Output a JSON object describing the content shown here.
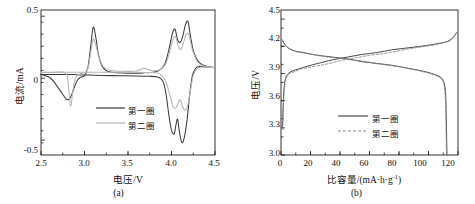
{
  "figure": {
    "panel_a_caption": "(a)",
    "panel_b_caption": "(b)"
  },
  "panel_a": {
    "xlabel": "电压/V",
    "ylabel": "电流/mA",
    "xticks": [
      "2.5",
      "3.0",
      "3.5",
      "4.0",
      "4.5"
    ],
    "yticks": [
      "0.5",
      "0",
      "-0.5"
    ],
    "legend": [
      {
        "label": "第一圈",
        "color": "#3a3a3a",
        "style": "solid"
      },
      {
        "label": "第二圈",
        "color": "#b0b0b0",
        "style": "solid"
      }
    ]
  },
  "panel_b": {
    "xlabel_main": "比容量/(mA·h·g",
    "xlabel_sup": "-1",
    "xlabel_tail": ")",
    "ylabel": "电压/V",
    "xticks": [
      "0",
      "20",
      "40",
      "60",
      "80",
      "100",
      "120"
    ],
    "yticks": [
      "4.5",
      "4.2",
      "3.9",
      "3.6",
      "3.3",
      "3.0"
    ],
    "legend": [
      {
        "label": "第一圈",
        "color": "#4a4a4a",
        "style": "solid"
      },
      {
        "label": "第二圈",
        "color": "#8a8a8a",
        "style": "dashed"
      }
    ]
  },
  "chart_data": [
    {
      "type": "line",
      "title": "(a) 循环伏安曲线",
      "xlabel": "电压/V",
      "ylabel": "电流/mA",
      "xlim": [
        2.5,
        4.5
      ],
      "ylim": [
        -0.62,
        0.55
      ],
      "xticks": [
        2.5,
        3.0,
        3.5,
        4.0,
        4.5
      ],
      "yticks": [
        0.5,
        0,
        -0.5
      ],
      "grid": false,
      "legend_position": "center",
      "series": [
        {
          "name": "第一圈",
          "color": "#3a3a3a",
          "points": [
            [
              2.5,
              0.03
            ],
            [
              2.55,
              0.02
            ],
            [
              2.6,
              0.005
            ],
            [
              2.65,
              -0.03
            ],
            [
              2.7,
              -0.08
            ],
            [
              2.74,
              -0.12
            ],
            [
              2.78,
              -0.16
            ],
            [
              2.8,
              -0.175
            ],
            [
              2.83,
              -0.165
            ],
            [
              2.86,
              -0.12
            ],
            [
              2.89,
              -0.06
            ],
            [
              2.92,
              -0.015
            ],
            [
              2.95,
              0.005
            ],
            [
              3.0,
              0.02
            ],
            [
              3.04,
              0.09
            ],
            [
              3.07,
              0.25
            ],
            [
              3.1,
              0.41
            ],
            [
              3.13,
              0.33
            ],
            [
              3.16,
              0.19
            ],
            [
              3.2,
              0.1
            ],
            [
              3.25,
              0.06
            ],
            [
              3.35,
              0.045
            ],
            [
              3.5,
              0.04
            ],
            [
              3.65,
              0.04
            ],
            [
              3.7,
              0.045
            ],
            [
              3.75,
              0.045
            ],
            [
              3.85,
              0.06
            ],
            [
              3.92,
              0.11
            ],
            [
              3.97,
              0.23
            ],
            [
              4.01,
              0.36
            ],
            [
              4.04,
              0.395
            ],
            [
              4.07,
              0.31
            ],
            [
              4.1,
              0.29
            ],
            [
              4.13,
              0.34
            ],
            [
              4.16,
              0.43
            ],
            [
              4.19,
              0.455
            ],
            [
              4.22,
              0.33
            ],
            [
              4.26,
              0.2
            ],
            [
              4.32,
              0.125
            ],
            [
              4.4,
              0.095
            ],
            [
              4.5,
              0.085
            ]
          ]
        },
        {
          "name": "第一圈-还原",
          "color": "#3a3a3a",
          "points": [
            [
              4.5,
              0.085
            ],
            [
              4.4,
              0.09
            ],
            [
              4.32,
              0.095
            ],
            [
              4.28,
              0.08
            ],
            [
              4.24,
              0.02
            ],
            [
              4.21,
              -0.13
            ],
            [
              4.18,
              -0.33
            ],
            [
              4.15,
              -0.47
            ],
            [
              4.12,
              -0.52
            ],
            [
              4.09,
              -0.43
            ],
            [
              4.07,
              -0.33
            ],
            [
              4.05,
              -0.38
            ],
            [
              4.03,
              -0.45
            ],
            [
              4.0,
              -0.42
            ],
            [
              3.97,
              -0.3
            ],
            [
              3.94,
              -0.14
            ],
            [
              3.91,
              -0.04
            ],
            [
              3.88,
              -0.005
            ],
            [
              3.84,
              0.01
            ],
            [
              3.75,
              0.015
            ],
            [
              3.6,
              0.018
            ],
            [
              3.4,
              0.02
            ],
            [
              3.2,
              0.022
            ],
            [
              3.05,
              0.025
            ],
            [
              2.95,
              0.025
            ],
            [
              2.9,
              0.028
            ],
            [
              2.85,
              0.03
            ],
            [
              2.7,
              0.03
            ],
            [
              2.5,
              0.03
            ]
          ]
        },
        {
          "name": "第二圈",
          "color": "#b5b5b5",
          "points": [
            [
              2.5,
              0.045
            ],
            [
              2.6,
              0.048
            ],
            [
              2.7,
              0.05
            ],
            [
              2.76,
              0.048
            ],
            [
              2.8,
              0.02
            ],
            [
              2.82,
              -0.1
            ],
            [
              2.84,
              -0.225
            ],
            [
              2.86,
              -0.14
            ],
            [
              2.88,
              -0.04
            ],
            [
              2.91,
              0.015
            ],
            [
              2.95,
              0.035
            ],
            [
              3.0,
              0.045
            ],
            [
              3.04,
              0.08
            ],
            [
              3.07,
              0.2
            ],
            [
              3.1,
              0.315
            ],
            [
              3.13,
              0.265
            ],
            [
              3.17,
              0.16
            ],
            [
              3.22,
              0.09
            ],
            [
              3.3,
              0.062
            ],
            [
              3.45,
              0.055
            ],
            [
              3.6,
              0.058
            ],
            [
              3.68,
              0.08
            ],
            [
              3.72,
              0.072
            ],
            [
              3.78,
              0.06
            ],
            [
              3.86,
              0.065
            ],
            [
              3.93,
              0.11
            ],
            [
              3.98,
              0.215
            ],
            [
              4.02,
              0.32
            ],
            [
              4.05,
              0.33
            ],
            [
              4.08,
              0.25
            ],
            [
              4.11,
              0.235
            ],
            [
              4.14,
              0.29
            ],
            [
              4.17,
              0.355
            ],
            [
              4.2,
              0.35
            ],
            [
              4.24,
              0.23
            ],
            [
              4.3,
              0.13
            ],
            [
              4.38,
              0.095
            ],
            [
              4.5,
              0.085
            ]
          ]
        },
        {
          "name": "第二圈-还原",
          "color": "#b5b5b5",
          "points": [
            [
              4.5,
              0.085
            ],
            [
              4.42,
              0.088
            ],
            [
              4.34,
              0.09
            ],
            [
              4.29,
              0.075
            ],
            [
              4.25,
              0.02
            ],
            [
              4.22,
              -0.09
            ],
            [
              4.19,
              -0.21
            ],
            [
              4.16,
              -0.26
            ],
            [
              4.13,
              -0.235
            ],
            [
              4.1,
              -0.175
            ],
            [
              4.08,
              -0.195
            ],
            [
              4.05,
              -0.24
            ],
            [
              4.02,
              -0.23
            ],
            [
              3.99,
              -0.16
            ],
            [
              3.96,
              -0.08
            ],
            [
              3.93,
              -0.02
            ],
            [
              3.89,
              0.02
            ],
            [
              3.85,
              0.04
            ],
            [
              3.78,
              0.045
            ],
            [
              3.6,
              0.048
            ],
            [
              3.4,
              0.048
            ],
            [
              3.2,
              0.048
            ],
            [
              3.0,
              0.048
            ],
            [
              2.8,
              0.048
            ],
            [
              2.6,
              0.046
            ],
            [
              2.5,
              0.045
            ]
          ]
        }
      ]
    },
    {
      "type": "line",
      "title": "(b) 充放电曲线",
      "xlabel": "比容量/(mA·h·g-1)",
      "ylabel": "电压/V",
      "xlim": [
        0,
        120
      ],
      "ylim": [
        3.0,
        4.6
      ],
      "xticks": [
        0,
        20,
        40,
        60,
        80,
        100,
        120
      ],
      "yticks": [
        3.0,
        3.3,
        3.6,
        3.9,
        4.2,
        4.5
      ],
      "grid": false,
      "legend_position": "center",
      "series": [
        {
          "name": "第一圈-充电",
          "color": "#4a4a4a",
          "style": "solid",
          "points": [
            [
              1.0,
              3.3
            ],
            [
              1.5,
              3.55
            ],
            [
              2.0,
              3.72
            ],
            [
              3.0,
              3.84
            ],
            [
              5.0,
              3.9
            ],
            [
              8.0,
              3.93
            ],
            [
              12.0,
              3.95
            ],
            [
              18.0,
              3.98
            ],
            [
              25.0,
              4.01
            ],
            [
              35.0,
              4.05
            ],
            [
              45.0,
              4.08
            ],
            [
              55.0,
              4.11
            ],
            [
              65.0,
              4.13
            ],
            [
              75.0,
              4.16
            ],
            [
              85.0,
              4.18
            ],
            [
              95.0,
              4.2
            ],
            [
              103.0,
              4.22
            ],
            [
              110.0,
              4.24
            ],
            [
              114.0,
              4.26
            ],
            [
              117.0,
              4.3
            ],
            [
              119.0,
              4.35
            ]
          ]
        },
        {
          "name": "第一圈-放电",
          "color": "#4a4a4a",
          "style": "solid",
          "points": [
            [
              1.0,
              4.27
            ],
            [
              2.5,
              4.22
            ],
            [
              5.0,
              4.18
            ],
            [
              9.0,
              4.15
            ],
            [
              15.0,
              4.13
            ],
            [
              25.0,
              4.1
            ],
            [
              35.0,
              4.08
            ],
            [
              45.0,
              4.06
            ],
            [
              55.0,
              4.03
            ],
            [
              65.0,
              4.01
            ],
            [
              75.0,
              3.99
            ],
            [
              85.0,
              3.96
            ],
            [
              95.0,
              3.93
            ],
            [
              102.0,
              3.9
            ],
            [
              107.0,
              3.87
            ],
            [
              110.0,
              3.82
            ],
            [
              111.5,
              3.7
            ],
            [
              112.0,
              3.45
            ],
            [
              112.3,
              3.2
            ],
            [
              112.5,
              3.0
            ]
          ]
        },
        {
          "name": "第二圈-充电",
          "color": "#8a8a8a",
          "style": "dashed",
          "points": [
            [
              1.2,
              3.28
            ],
            [
              1.6,
              3.52
            ],
            [
              2.2,
              3.7
            ],
            [
              3.2,
              3.83
            ],
            [
              5.2,
              3.89
            ],
            [
              9.0,
              3.92
            ],
            [
              14.0,
              3.95
            ],
            [
              20.0,
              3.97
            ],
            [
              30.0,
              4.0
            ],
            [
              40.0,
              4.04
            ],
            [
              50.0,
              4.07
            ],
            [
              60.0,
              4.1
            ],
            [
              70.0,
              4.12
            ],
            [
              80.0,
              4.15
            ],
            [
              90.0,
              4.18
            ],
            [
              98.0,
              4.2
            ],
            [
              106.0,
              4.22
            ],
            [
              112.0,
              4.25
            ],
            [
              116.0,
              4.29
            ],
            [
              118.5,
              4.34
            ]
          ]
        },
        {
          "name": "第二圈-放电",
          "color": "#8a8a8a",
          "style": "dashed",
          "points": [
            [
              1.2,
              4.26
            ],
            [
              3.0,
              4.21
            ],
            [
              6.0,
              4.17
            ],
            [
              10.0,
              4.14
            ],
            [
              18.0,
              4.12
            ],
            [
              28.0,
              4.09
            ],
            [
              38.0,
              4.07
            ],
            [
              48.0,
              4.05
            ],
            [
              58.0,
              4.03
            ],
            [
              68.0,
              4.0
            ],
            [
              78.0,
              3.98
            ],
            [
              88.0,
              3.95
            ],
            [
              96.0,
              3.92
            ],
            [
              103.0,
              3.89
            ],
            [
              108.0,
              3.85
            ],
            [
              110.5,
              3.78
            ],
            [
              111.5,
              3.6
            ],
            [
              111.9,
              3.3
            ],
            [
              112.1,
              3.05
            ],
            [
              112.2,
              3.0
            ]
          ]
        }
      ]
    }
  ]
}
